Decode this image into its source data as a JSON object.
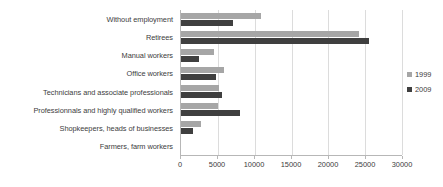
{
  "chart_data": {
    "type": "bar",
    "orientation": "horizontal",
    "title": "",
    "xlabel": "",
    "ylabel": "",
    "xlim": [
      0,
      30000
    ],
    "xticks": [
      0,
      5000,
      10000,
      15000,
      20000,
      25000,
      30000
    ],
    "xtick_labels": [
      "0",
      "5000",
      "10000",
      "15000",
      "20000",
      "25000",
      "30000"
    ],
    "grid": true,
    "legend_position": "right",
    "categories": [
      "Without employment",
      "Retirees",
      "Manual workers",
      "Office workers",
      "Technicians and associate professionals",
      "Professionnals and highly qualified workers",
      "Shopkeepers, heads of businesses",
      "Farmers, farm workers"
    ],
    "series": [
      {
        "name": "1999",
        "color": "#a6a6a6",
        "values": [
          10800,
          24200,
          4500,
          5800,
          5200,
          5000,
          2700,
          0
        ]
      },
      {
        "name": "2009",
        "color": "#3f3f3f",
        "values": [
          7000,
          25500,
          2400,
          4700,
          5600,
          8000,
          1600,
          0
        ]
      }
    ]
  },
  "legend": {
    "items": [
      {
        "label": "1999",
        "color": "#a6a6a6"
      },
      {
        "label": "2009",
        "color": "#3f3f3f"
      }
    ]
  }
}
